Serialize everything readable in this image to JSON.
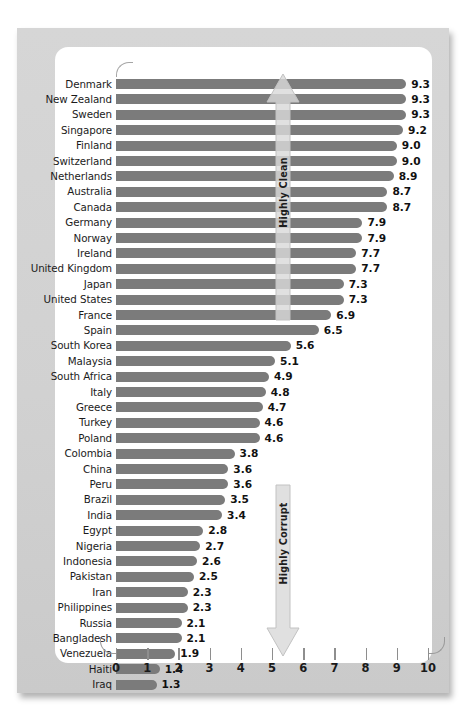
{
  "chart_data": {
    "type": "bar",
    "orientation": "horizontal",
    "title": "",
    "xlabel": "",
    "ylabel": "",
    "xlim": [
      0,
      10
    ],
    "xticks": [
      "0",
      "1",
      "2",
      "3",
      "4",
      "5",
      "6",
      "7",
      "8",
      "9",
      "10"
    ],
    "grid": false,
    "legend": null,
    "bar_color": "#7b7b7b",
    "annotations": [
      {
        "text": "Highly Clean",
        "direction": "up",
        "position": "upper-middle"
      },
      {
        "text": "Highly Corrupt",
        "direction": "down",
        "position": "lower-middle"
      }
    ],
    "categories": [
      "Denmark",
      "New Zealand",
      "Sweden",
      "Singapore",
      "Finland",
      "Switzerland",
      "Netherlands",
      "Australia",
      "Canada",
      "Germany",
      "Norway",
      "Ireland",
      "United Kingdom",
      "Japan",
      "United States",
      "France",
      "Spain",
      "South Korea",
      "Malaysia",
      "South Africa",
      "Italy",
      "Greece",
      "Turkey",
      "Poland",
      "Colombia",
      "China",
      "Peru",
      "Brazil",
      "India",
      "Egypt",
      "Nigeria",
      "Indonesia",
      "Pakistan",
      "Iran",
      "Philippines",
      "Russia",
      "Bangladesh",
      "Venezuela",
      "Haiti",
      "Iraq"
    ],
    "values": [
      9.3,
      9.3,
      9.3,
      9.2,
      9.0,
      9.0,
      8.9,
      8.7,
      8.7,
      7.9,
      7.9,
      7.7,
      7.7,
      7.3,
      7.3,
      6.9,
      6.5,
      5.6,
      5.1,
      4.9,
      4.8,
      4.7,
      4.6,
      4.6,
      3.8,
      3.6,
      3.6,
      3.5,
      3.4,
      2.8,
      2.7,
      2.6,
      2.5,
      2.3,
      2.3,
      2.1,
      2.1,
      1.9,
      1.4,
      1.3
    ],
    "value_labels": [
      "9.3",
      "9.3",
      "9.3",
      "9.2",
      "9.0",
      "9.0",
      "8.9",
      "8.7",
      "8.7",
      "7.9",
      "7.9",
      "7.7",
      "7.7",
      "7.3",
      "7.3",
      "6.9",
      "6.5",
      "5.6",
      "5.1",
      "4.9",
      "4.8",
      "4.7",
      "4.6",
      "4.6",
      "3.8",
      "3.6",
      "3.6",
      "3.5",
      "3.4",
      "2.8",
      "2.7",
      "2.6",
      "2.5",
      "2.3",
      "2.3",
      "2.1",
      "2.1",
      "1.9",
      "1.4",
      "1.3"
    ]
  }
}
